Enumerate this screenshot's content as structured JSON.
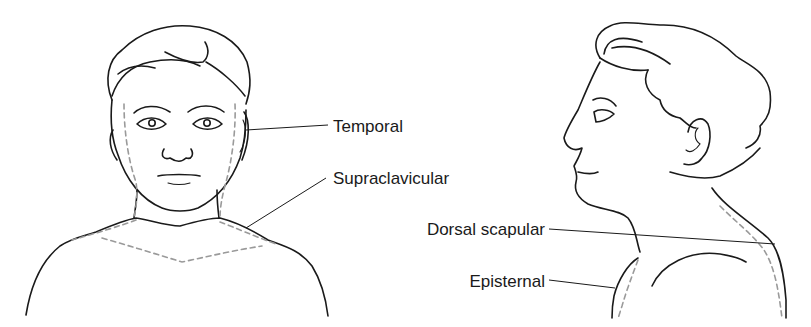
{
  "figure": {
    "type": "anatomical line drawing",
    "views": [
      {
        "name": "frontal view",
        "side": "left"
      },
      {
        "name": "lateral (profile) view",
        "side": "right"
      }
    ],
    "labels": [
      {
        "id": "temporal",
        "text": "Temporal",
        "view": "frontal"
      },
      {
        "id": "supraclavicular",
        "text": "Supraclavicular",
        "view": "frontal"
      },
      {
        "id": "dorsal_scapular",
        "text": "Dorsal scapular",
        "view": "lateral"
      },
      {
        "id": "episternal",
        "text": "Episternal",
        "view": "lateral"
      }
    ],
    "colors": {
      "outline": "#1a1a1a",
      "region_dashes": "#9a9a9a",
      "background": "#ffffff"
    }
  }
}
